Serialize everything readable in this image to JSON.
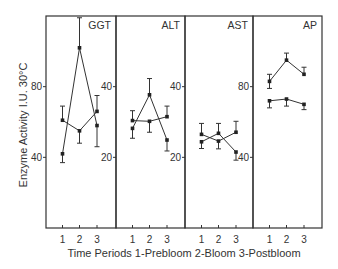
{
  "chart_data": {
    "type": "line",
    "title": "",
    "xlabel": "Time Periods 1-Prebloom 2-Bloom 3-Postbloom",
    "ylabel": "Enzyme Activity I.U. 30°C",
    "grid": false,
    "legend": null,
    "x": [
      1,
      2,
      3
    ],
    "x_tick_labels": [
      "1",
      "2",
      "3"
    ],
    "panels": [
      {
        "name": "GGT",
        "ylim": [
          0,
          120
        ],
        "y_ticks": [
          40,
          80
        ],
        "y_tick_labels": [
          "40",
          "80"
        ],
        "series": [
          {
            "name": "series-a",
            "values": [
              61,
              55,
              66
            ],
            "err_upper": [
              69,
              55,
              75
            ],
            "err_lower": [
              61,
              48,
              66
            ]
          },
          {
            "name": "series-b",
            "values": [
              42,
              102,
              58
            ],
            "err_upper": [
              42,
              119,
              58
            ],
            "err_lower": [
              37,
              102,
              46
            ]
          }
        ]
      },
      {
        "name": "ALT",
        "ylim": [
          0,
          60
        ],
        "y_ticks": [
          20,
          40
        ],
        "y_tick_labels": [
          "20",
          "40"
        ],
        "series": [
          {
            "name": "series-a",
            "values": [
              30.4,
              30.2,
              31.5
            ],
            "err_upper": [
              33.2,
              30.2,
              34.5
            ],
            "err_lower": [
              30.4,
              27.1,
              31.5
            ]
          },
          {
            "name": "series-b",
            "values": [
              28.2,
              37.7,
              24.9
            ],
            "err_upper": [
              28.2,
              42.3,
              24.9
            ],
            "err_lower": [
              25.4,
              37.7,
              21.8
            ]
          }
        ]
      },
      {
        "name": "AST",
        "ylim": [
          0,
          60
        ],
        "y_ticks": [
          20,
          40
        ],
        "y_tick_labels": [
          "20",
          "40"
        ],
        "series": [
          {
            "name": "series-a",
            "values": [
              26.5,
              24.6,
              27.1
            ],
            "err_upper": [
              29.6,
              24.6,
              30.2
            ],
            "err_lower": [
              26.5,
              22.4,
              27.1
            ]
          },
          {
            "name": "series-b",
            "values": [
              24.4,
              26.8,
              21.5
            ],
            "err_upper": [
              24.4,
              29.6,
              21.5
            ],
            "err_lower": [
              22.5,
              26.8,
              19.2
            ]
          }
        ]
      },
      {
        "name": "AP",
        "ylim": [
          0,
          120
        ],
        "y_ticks": [
          40,
          80
        ],
        "y_tick_labels": [
          "40",
          "80"
        ],
        "series": [
          {
            "name": "series-a",
            "values": [
              83,
              95,
              87
            ],
            "err_upper": [
              87,
              99,
              91
            ],
            "err_lower": [
              79,
              95,
              87
            ]
          },
          {
            "name": "series-b",
            "values": [
              72,
              73,
              70
            ],
            "err_upper": [
              72,
              73,
              70
            ],
            "err_lower": [
              68,
              69,
              67
            ]
          }
        ]
      }
    ]
  },
  "layout": {
    "frame": {
      "left": 46,
      "right": 322,
      "top": 16,
      "bottom": 228
    },
    "panel_edges": [
      46,
      116,
      185,
      253,
      322
    ],
    "x_tick_offsets": [
      16.5,
      33.5,
      51
    ]
  }
}
